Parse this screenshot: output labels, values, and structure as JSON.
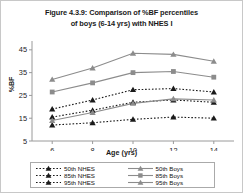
{
  "chart_data": {
    "type": "line",
    "title": "Figure 4.3.9: Comparison of %BF percentiles of boys (6-14 yrs) with NHES I",
    "title_line1": "Figure 4.3.9: Comparison of %BF percentiles",
    "title_line2": "of  boys (6-14 yrs) with NHES I",
    "xlabel": "Age (yrs)",
    "ylabel": "%BF",
    "x": [
      6,
      8,
      10,
      12,
      14
    ],
    "xtick_labels": [
      "6",
      "8",
      "10",
      "12",
      "14"
    ],
    "ytick_labels": [
      "5",
      "15",
      "25",
      "35",
      "45"
    ],
    "ytick_values": [
      5,
      15,
      25,
      35,
      45
    ],
    "xlim": [
      5,
      15
    ],
    "ylim": [
      5,
      48
    ],
    "grid": false,
    "legend_position": "bottom",
    "series": [
      {
        "name": "50th  NHES",
        "group": "NHES",
        "style": "dotted",
        "marker": "triangle",
        "color": "#1a1a1a",
        "values": [
          12.0,
          13.0,
          14.5,
          15.5,
          15.0
        ]
      },
      {
        "name": "85th  NHES",
        "group": "NHES",
        "style": "dotted",
        "marker": "triangle",
        "color": "#1a1a1a",
        "values": [
          15.5,
          18.5,
          22.0,
          23.0,
          22.0
        ]
      },
      {
        "name": "95th  NHES",
        "group": "NHES",
        "style": "dotted",
        "marker": "triangle",
        "color": "#1a1a1a",
        "values": [
          19.0,
          23.0,
          27.5,
          28.0,
          26.5
        ]
      },
      {
        "name": "50th  Boys",
        "group": "Boys",
        "style": "solid",
        "marker": "triangle",
        "color": "#8c8c8c",
        "values": [
          14.0,
          17.5,
          21.5,
          23.5,
          23.0
        ]
      },
      {
        "name": "85th  Boys",
        "group": "Boys",
        "style": "solid",
        "marker": "square",
        "color": "#8c8c8c",
        "values": [
          26.5,
          30.5,
          35.0,
          35.5,
          33.0
        ]
      },
      {
        "name": "95th  Boys",
        "group": "Boys",
        "style": "solid",
        "marker": "triangle",
        "color": "#8c8c8c",
        "values": [
          32.0,
          37.0,
          43.5,
          43.0,
          40.0
        ]
      }
    ],
    "legend": {
      "col_left": [
        "50th  NHES",
        "85th  NHES",
        "95th  NHES"
      ],
      "col_right": [
        "50th  Boys",
        "85th  Boys",
        "95th  Boys"
      ]
    }
  }
}
